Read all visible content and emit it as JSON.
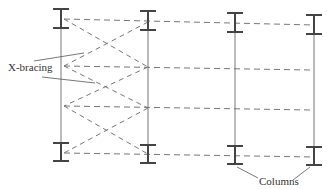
{
  "diagram": {
    "type": "structural-plan",
    "labels": {
      "x_bracing": "X-bracing",
      "columns": "Columns"
    },
    "colors": {
      "beam": "#444444",
      "column_line": "#777777",
      "dashed": "#777777",
      "text": "#333333"
    },
    "columns_x": [
      61,
      148,
      235,
      314
    ],
    "top_beam_y": [
      9,
      28
    ],
    "bottom_beam_y": [
      146,
      165
    ],
    "horizontal_lines_y": [
      {
        "left": 19,
        "right": 24
      },
      {
        "left": 66,
        "right": 70
      },
      {
        "left": 106,
        "right": 110
      },
      {
        "left": 153,
        "right": 157
      }
    ]
  }
}
